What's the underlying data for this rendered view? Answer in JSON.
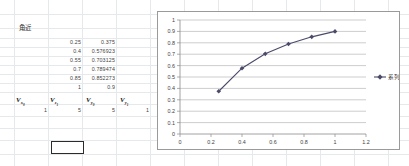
{
  "app": {
    "type": "spreadsheet",
    "grid_color": "#e6e9ec",
    "background": "#ffffff"
  },
  "sheet": {
    "label_cell": "角近",
    "table": {
      "rows": [
        {
          "x": "0.25",
          "y": "0.375"
        },
        {
          "x": "0.4",
          "y": "0.576923"
        },
        {
          "x": "0.55",
          "y": "0.703125"
        },
        {
          "x": "0.7",
          "y": "0.789474"
        },
        {
          "x": "0.85",
          "y": "0.852273"
        },
        {
          "x": "1",
          "y": "0.9"
        }
      ]
    },
    "variables": [
      {
        "name": "V",
        "sub": "x",
        "subsub": "0",
        "value": "1"
      },
      {
        "name": "V",
        "sub": "z",
        "subsub": "1",
        "value": "5"
      },
      {
        "name": "V",
        "sub": "y",
        "subsub": "0",
        "value": "5"
      },
      {
        "name": "V",
        "sub": "y",
        "subsub": "1",
        "value": "1"
      }
    ],
    "selected_cell": {
      "value": "",
      "border_color": "#2b2b2b"
    }
  },
  "chart_data": {
    "type": "line",
    "title": "",
    "xlabel": "",
    "ylabel": "",
    "x": [
      0.25,
      0.4,
      0.55,
      0.7,
      0.85,
      1
    ],
    "series": [
      {
        "name": "系列1",
        "values": [
          0.375,
          0.576923,
          0.703125,
          0.789474,
          0.852273,
          0.9
        ],
        "color": "#4a4a6a",
        "marker": "diamond"
      }
    ],
    "xlim": [
      0,
      1.2
    ],
    "ylim": [
      0,
      1
    ],
    "xticks": [
      "0",
      "0.2",
      "0.4",
      "0.6",
      "0.8",
      "1",
      "1.2"
    ],
    "xtick_values": [
      0,
      0.2,
      0.4,
      0.6,
      0.8,
      1,
      1.2
    ],
    "yticks": [
      "0",
      "0.1",
      "0.2",
      "0.3",
      "0.4",
      "0.5",
      "0.6",
      "0.7",
      "0.8",
      "0.9",
      "1"
    ],
    "ytick_values": [
      0,
      0.1,
      0.2,
      0.3,
      0.4,
      0.5,
      0.6,
      0.7,
      0.8,
      0.9,
      1
    ],
    "grid": "horizontal",
    "gridline_color": "#b8b8b8",
    "legend_position": "right",
    "plot_border_color": "#9a9a9a"
  }
}
